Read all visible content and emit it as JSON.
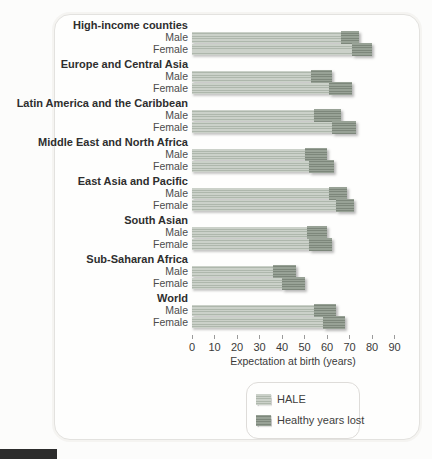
{
  "figure": {
    "male_label": "Male",
    "female_label": "Female",
    "colors": {
      "hale_light": "#b9c2b7",
      "healthy_years_lost_dark": "#8a9488",
      "panel_border": "#e3e2df",
      "footer_mark": "#2c2c2c"
    }
  },
  "chart_data": {
    "type": "bar",
    "orientation": "horizontal",
    "stacked": true,
    "title": "",
    "xlabel": "Expectation at birth (years)",
    "ylabel": "",
    "xlim": [
      0,
      90
    ],
    "x_ticks": [
      0,
      10,
      20,
      30,
      40,
      50,
      60,
      70,
      80,
      90
    ],
    "grid": false,
    "legend_position": "bottom",
    "legend": [
      {
        "label": "HALE",
        "color": "#b9c2b7"
      },
      {
        "label": "Healthy years lost",
        "color": "#8a9488"
      }
    ],
    "groups": [
      {
        "region": "High-income counties",
        "bars": [
          {
            "sex": "Male",
            "hale": 66,
            "healthy_years_lost": 8,
            "total": 74
          },
          {
            "sex": "Female",
            "hale": 71,
            "healthy_years_lost": 9,
            "total": 80
          }
        ]
      },
      {
        "region": "Europe and Central Asia",
        "bars": [
          {
            "sex": "Male",
            "hale": 53,
            "healthy_years_lost": 9,
            "total": 62
          },
          {
            "sex": "Female",
            "hale": 61,
            "healthy_years_lost": 10,
            "total": 71
          }
        ]
      },
      {
        "region": "Latin America and the Caribbean",
        "bars": [
          {
            "sex": "Male",
            "hale": 54,
            "healthy_years_lost": 12,
            "total": 66
          },
          {
            "sex": "Female",
            "hale": 62,
            "healthy_years_lost": 11,
            "total": 73
          }
        ]
      },
      {
        "region": "Middle East and North Africa",
        "bars": [
          {
            "sex": "Male",
            "hale": 50,
            "healthy_years_lost": 10,
            "total": 60
          },
          {
            "sex": "Female",
            "hale": 52,
            "healthy_years_lost": 11,
            "total": 63
          }
        ]
      },
      {
        "region": "East Asia and Pacific",
        "bars": [
          {
            "sex": "Male",
            "hale": 61,
            "healthy_years_lost": 8,
            "total": 69
          },
          {
            "sex": "Female",
            "hale": 64,
            "healthy_years_lost": 8,
            "total": 72
          }
        ]
      },
      {
        "region": "South Asian",
        "bars": [
          {
            "sex": "Male",
            "hale": 51,
            "healthy_years_lost": 9,
            "total": 60
          },
          {
            "sex": "Female",
            "hale": 52,
            "healthy_years_lost": 10,
            "total": 62
          }
        ]
      },
      {
        "region": "Sub-Saharan Africa",
        "bars": [
          {
            "sex": "Male",
            "hale": 36,
            "healthy_years_lost": 10,
            "total": 46
          },
          {
            "sex": "Female",
            "hale": 40,
            "healthy_years_lost": 10,
            "total": 50
          }
        ]
      },
      {
        "region": "World",
        "bars": [
          {
            "sex": "Male",
            "hale": 54,
            "healthy_years_lost": 10,
            "total": 64
          },
          {
            "sex": "Female",
            "hale": 58,
            "healthy_years_lost": 10,
            "total": 68
          }
        ]
      }
    ]
  }
}
